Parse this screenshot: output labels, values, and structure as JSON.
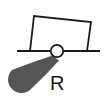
{
  "diagram": {
    "type": "schematic-symbol",
    "label": "R",
    "colors": {
      "stroke": "#1a1a1a",
      "fill_blob": "#555555",
      "background": "#ffffff"
    },
    "elements": {
      "baseline": {
        "x1": 17,
        "y1": 51,
        "x2": 100,
        "y2": 51
      },
      "box": {
        "points": [
          [
            30,
            51
          ],
          [
            34,
            16
          ],
          [
            91,
            22
          ],
          [
            87,
            51
          ]
        ]
      },
      "pivot_circle": {
        "cx": 57,
        "cy": 51,
        "r": 6
      },
      "teardrop": {
        "tip": [
          53,
          56
        ],
        "blob_center": [
          22,
          80
        ],
        "blob_radius": 13
      }
    }
  }
}
